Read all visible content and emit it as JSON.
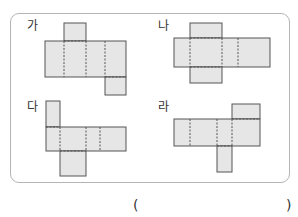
{
  "labels": {
    "a": "가",
    "b": "나",
    "c": "다",
    "d": "라"
  },
  "answer": {
    "open_paren": "(",
    "close_paren": ")",
    "value": ""
  },
  "colors": {
    "face_fill": "#e6e6e6",
    "edge_stroke": "#555555",
    "frame_stroke": "#b5b5b5"
  },
  "nets": [
    {
      "label": "가",
      "faces": 6,
      "description": "cuboid net with top flap over 2nd face and bottom flap under 4th face"
    },
    {
      "label": "나",
      "faces": 6,
      "description": "cross-shaped cuboid net with top and bottom flaps on 2nd face"
    },
    {
      "label": "다",
      "faces": 6,
      "description": "net with top flap on 1st face and bottom flap under 2nd face"
    },
    {
      "label": "라",
      "faces": 6,
      "description": "net with top flap on 4th face and bottom flap under 3rd face"
    }
  ]
}
